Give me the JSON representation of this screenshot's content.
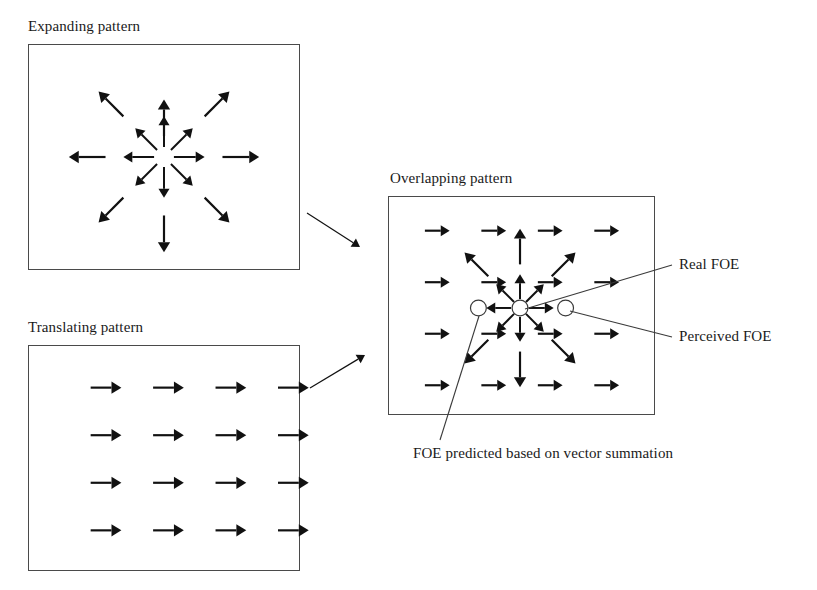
{
  "figure": {
    "width": 817,
    "height": 590,
    "background": "#ffffff",
    "ink_color": "#111111",
    "frame_color": "#4a4a4a",
    "line_color": "#3a3a3a"
  },
  "panels": [
    {
      "id": "expanding",
      "caption": "Expanding pattern",
      "caption_x": 28,
      "caption_y": 18,
      "frame": {
        "x": 28,
        "y": 44,
        "w": 272,
        "h": 226
      },
      "pattern": "radial-expansion",
      "center": {
        "x": 136,
        "y": 113
      },
      "arrows": [
        {
          "name": "inner-n",
          "x1": 136,
          "y1": 103,
          "x2": 136,
          "y2": 72,
          "w": 2.0,
          "head": 9
        },
        {
          "name": "inner-ne",
          "x1": 143,
          "y1": 106,
          "x2": 165,
          "y2": 84,
          "w": 2.0,
          "head": 9
        },
        {
          "name": "inner-e",
          "x1": 146,
          "y1": 113,
          "x2": 177,
          "y2": 113,
          "w": 2.0,
          "head": 9
        },
        {
          "name": "inner-se",
          "x1": 143,
          "y1": 120,
          "x2": 165,
          "y2": 142,
          "w": 2.0,
          "head": 9
        },
        {
          "name": "inner-s",
          "x1": 136,
          "y1": 123,
          "x2": 136,
          "y2": 154,
          "w": 2.0,
          "head": 9
        },
        {
          "name": "inner-sw",
          "x1": 129,
          "y1": 120,
          "x2": 107,
          "y2": 142,
          "w": 2.0,
          "head": 9
        },
        {
          "name": "inner-w",
          "x1": 126,
          "y1": 113,
          "x2": 95,
          "y2": 113,
          "w": 2.0,
          "head": 9
        },
        {
          "name": "inner-nw",
          "x1": 129,
          "y1": 106,
          "x2": 107,
          "y2": 84,
          "w": 2.0,
          "head": 9
        },
        {
          "name": "outer-n",
          "x1": 136,
          "y1": 92,
          "x2": 136,
          "y2": 55,
          "w": 2.2,
          "head": 10
        },
        {
          "name": "outer-ne",
          "x1": 177,
          "y1": 72,
          "x2": 202,
          "y2": 47,
          "w": 2.2,
          "head": 10
        },
        {
          "name": "outer-e",
          "x1": 195,
          "y1": 113,
          "x2": 232,
          "y2": 113,
          "w": 2.2,
          "head": 10
        },
        {
          "name": "outer-se",
          "x1": 177,
          "y1": 154,
          "x2": 202,
          "y2": 179,
          "w": 2.2,
          "head": 10
        },
        {
          "name": "outer-s",
          "x1": 136,
          "y1": 172,
          "x2": 136,
          "y2": 209,
          "w": 2.2,
          "head": 10
        },
        {
          "name": "outer-sw",
          "x1": 95,
          "y1": 154,
          "x2": 70,
          "y2": 179,
          "w": 2.2,
          "head": 10
        },
        {
          "name": "outer-w",
          "x1": 77,
          "y1": 113,
          "x2": 40,
          "y2": 113,
          "w": 2.2,
          "head": 10
        },
        {
          "name": "outer-nw",
          "x1": 95,
          "y1": 72,
          "x2": 70,
          "y2": 47,
          "w": 2.2,
          "head": 10
        }
      ],
      "circles": []
    },
    {
      "id": "translating",
      "caption": "Translating pattern",
      "caption_x": 28,
      "caption_y": 319,
      "frame": {
        "x": 28,
        "y": 345,
        "w": 272,
        "h": 226
      },
      "pattern": "uniform-translation",
      "grid": {
        "cols": 4,
        "rows": 4,
        "x0": 62,
        "dx": 63,
        "y0": 42,
        "dy": 48
      },
      "arrow_length": 31,
      "arrow_width": 2.2,
      "arrow_head": 10,
      "circles": []
    },
    {
      "id": "overlapping",
      "caption": "Overlapping pattern",
      "caption_x": 390,
      "caption_y": 170,
      "frame": {
        "x": 388,
        "y": 196,
        "w": 267,
        "h": 219
      },
      "pattern": "radial-plus-translation",
      "center": {
        "x": 132,
        "y": 112
      },
      "grid": {
        "cols": 4,
        "rows": 4,
        "x0": 36,
        "dx": 57,
        "y0": 34,
        "dy": 52
      },
      "arrow_length": 25,
      "arrow_width": 2.2,
      "arrow_head": 9,
      "radial_arrows": [
        {
          "name": "inner-n",
          "x1": 132,
          "y1": 103,
          "x2": 132,
          "y2": 78,
          "w": 2.0,
          "head": 9
        },
        {
          "name": "inner-ne",
          "x1": 138,
          "y1": 106,
          "x2": 156,
          "y2": 88,
          "w": 2.0,
          "head": 9
        },
        {
          "name": "inner-e",
          "x1": 141,
          "y1": 112,
          "x2": 166,
          "y2": 112,
          "w": 2.0,
          "head": 9
        },
        {
          "name": "inner-se",
          "x1": 138,
          "y1": 118,
          "x2": 156,
          "y2": 136,
          "w": 2.0,
          "head": 9
        },
        {
          "name": "inner-s",
          "x1": 132,
          "y1": 121,
          "x2": 132,
          "y2": 146,
          "w": 2.0,
          "head": 9
        },
        {
          "name": "inner-sw",
          "x1": 126,
          "y1": 118,
          "x2": 108,
          "y2": 136,
          "w": 2.0,
          "head": 9
        },
        {
          "name": "inner-w",
          "x1": 123,
          "y1": 112,
          "x2": 98,
          "y2": 112,
          "w": 2.0,
          "head": 9
        },
        {
          "name": "inner-nw",
          "x1": 126,
          "y1": 106,
          "x2": 108,
          "y2": 88,
          "w": 2.0,
          "head": 9
        },
        {
          "name": "outer-n",
          "x1": 132,
          "y1": 68,
          "x2": 132,
          "y2": 32,
          "w": 2.2,
          "head": 10
        },
        {
          "name": "outer-ne",
          "x1": 164,
          "y1": 80,
          "x2": 188,
          "y2": 56,
          "w": 2.2,
          "head": 10
        },
        {
          "name": "outer-se",
          "x1": 164,
          "y1": 144,
          "x2": 188,
          "y2": 168,
          "w": 2.2,
          "head": 10
        },
        {
          "name": "outer-s",
          "x1": 132,
          "y1": 156,
          "x2": 132,
          "y2": 192,
          "w": 2.2,
          "head": 10
        },
        {
          "name": "outer-sw",
          "x1": 100,
          "y1": 144,
          "x2": 76,
          "y2": 168,
          "w": 2.2,
          "head": 10
        },
        {
          "name": "outer-nw",
          "x1": 100,
          "y1": 80,
          "x2": 76,
          "y2": 56,
          "w": 2.2,
          "head": 10
        }
      ],
      "circles": [
        {
          "name": "foe-predicted-marker",
          "cx": 90,
          "cy": 112,
          "r": 8
        },
        {
          "name": "real-foe-marker",
          "cx": 132,
          "cy": 112,
          "r": 8
        },
        {
          "name": "perceived-foe-marker",
          "cx": 178,
          "cy": 112,
          "r": 8
        }
      ]
    }
  ],
  "connectors": [
    {
      "name": "expanding-to-overlapping-arrow",
      "x1": 307,
      "y1": 213,
      "x2": 360,
      "y2": 247,
      "w": 1.2,
      "head": 8
    },
    {
      "name": "translating-to-overlapping-arrow",
      "x1": 310,
      "y1": 388,
      "x2": 365,
      "y2": 355,
      "w": 1.2,
      "head": 8
    }
  ],
  "annotations": [
    {
      "id": "real-foe",
      "label": "Real FOE",
      "label_x": 679,
      "label_y": 256,
      "leader": {
        "x1": 525,
        "y1": 309,
        "x2": 672,
        "y2": 265
      }
    },
    {
      "id": "perceived-foe",
      "label": "Perceived FOE",
      "label_x": 679,
      "label_y": 328,
      "leader": {
        "x1": 570,
        "y1": 311,
        "x2": 672,
        "y2": 337
      }
    },
    {
      "id": "foe-predicted",
      "label": "FOE predicted based on vector summation",
      "label_x": 413,
      "label_y": 445,
      "leader": {
        "x1": 479,
        "y1": 316,
        "x2": 440,
        "y2": 440
      }
    }
  ]
}
